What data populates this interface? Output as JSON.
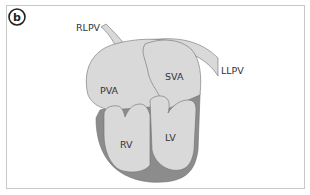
{
  "figure": {
    "panel_label": "b",
    "labels": {
      "rlpv": "RLPV",
      "llpv": "LLPV",
      "pva": "PVA",
      "sva": "SVA",
      "rv": "RV",
      "lv": "LV"
    },
    "colors": {
      "chamber_fill": "#d9d9d9",
      "myocardium_fill": "#8c8c8c",
      "outline": "#6e6e6e",
      "frame": "#c8c8c8"
    }
  }
}
